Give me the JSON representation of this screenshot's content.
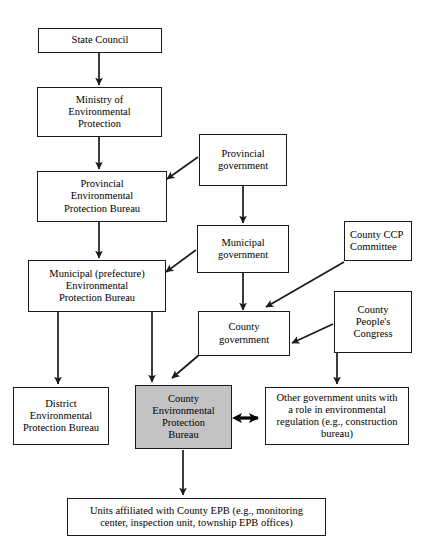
{
  "diagram": {
    "accent_shaded_color": "#c3c3c3",
    "line_color": "#1a1a1a",
    "nodes": {
      "state_council": {
        "label": "State Council"
      },
      "ministry_ep": {
        "label": "Ministry of\nEnvironmental\nProtection"
      },
      "provincial_epb": {
        "label": "Provincial\nEnvironmental\nProtection Bureau"
      },
      "municipal_epb": {
        "label": "Municipal (prefecture)\nEnvironmental\nProtection Bureau"
      },
      "provincial_government": {
        "label": "Provincial\ngovernment"
      },
      "municipal_government": {
        "label": "Municipal\ngovernment"
      },
      "county_government": {
        "label": "County\ngovernment"
      },
      "county_ccp_committee": {
        "label": "County CCP\nCommittee"
      },
      "county_peoples_congress": {
        "label": "County\nPeople's\nCongress"
      },
      "district_epb": {
        "label": "District\nEnvironmental\nProtection Bureau"
      },
      "county_epb": {
        "label": "County\nEnvironmental\nProtection\nBureau"
      },
      "other_government_units": {
        "label": "Other government units with\na role in environmental\nregulation (e.g., construction\nbureau)"
      },
      "affiliated_units": {
        "label": "Units affiliated with County EPB (e.g., monitoring\ncenter, inspection unit, township EPB offices)"
      }
    },
    "edges": [
      {
        "name": "state-council-to-ministry",
        "type": "vertical-arrow"
      },
      {
        "name": "ministry-to-provincial-epb",
        "type": "vertical-arrow"
      },
      {
        "name": "provincial-epb-to-municipal-epb",
        "type": "vertical-arrow"
      },
      {
        "name": "provincial-government-to-provincial-epb",
        "type": "diagonal-arrow"
      },
      {
        "name": "provincial-government-to-municipal-government",
        "type": "vertical-arrow"
      },
      {
        "name": "municipal-government-to-municipal-epb",
        "type": "diagonal-arrow"
      },
      {
        "name": "municipal-government-to-county-government",
        "type": "vertical-arrow"
      },
      {
        "name": "county-ccp-committee-to-county-government",
        "type": "diagonal-arrow"
      },
      {
        "name": "county-peoples-congress-to-county-government",
        "type": "diagonal-arrow"
      },
      {
        "name": "municipal-epb-to-district-epb",
        "type": "vertical-arrow"
      },
      {
        "name": "municipal-epb-to-county-epb",
        "type": "vertical-arrow"
      },
      {
        "name": "county-government-to-county-epb",
        "type": "diagonal-arrow"
      },
      {
        "name": "county-government-to-other-government-units",
        "type": "vertical-arrow"
      },
      {
        "name": "county-epb-to-other-government-units",
        "type": "double-headed-arrow"
      },
      {
        "name": "county-epb-to-affiliated-units",
        "type": "vertical-arrow"
      }
    ]
  }
}
